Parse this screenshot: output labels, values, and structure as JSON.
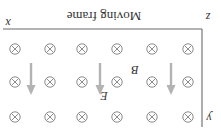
{
  "diagram": {
    "title": "Moving frame",
    "orientation": "rotated 180 degrees",
    "axes": {
      "x_label": "x",
      "y_label": "y",
      "z_label": "z"
    },
    "field_labels": {
      "magnetic": "B",
      "electric": "E"
    },
    "magnetic_field": {
      "symbol": "into-page (⊗)",
      "rows": 3,
      "columns": 6
    },
    "electric_field": {
      "arrow_count": 3,
      "direction_in_image": "down"
    },
    "colors": {
      "axis": "#6a6a6a",
      "field_symbol": "#8c8c8c",
      "e_arrow": "#b3b3b3",
      "text": "#333333"
    }
  }
}
